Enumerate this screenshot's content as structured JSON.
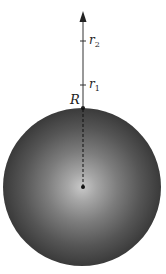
{
  "diagram": {
    "labels": {
      "radius": "R",
      "r1_base": "r",
      "r1_sub": "1",
      "r2_base": "r",
      "r2_sub": "2"
    },
    "sphere": {
      "center": [
        82,
        187
      ],
      "radius": 79,
      "center_color": "#c4c4c4",
      "mid_color": "#8a8a8a",
      "edge_color": "#3a3a3a"
    },
    "axis": {
      "arrow_tip_y": 12,
      "r2_tick_y": 41,
      "r1_tick_y": 85,
      "surface_y": 108,
      "color": "#333333"
    }
  }
}
